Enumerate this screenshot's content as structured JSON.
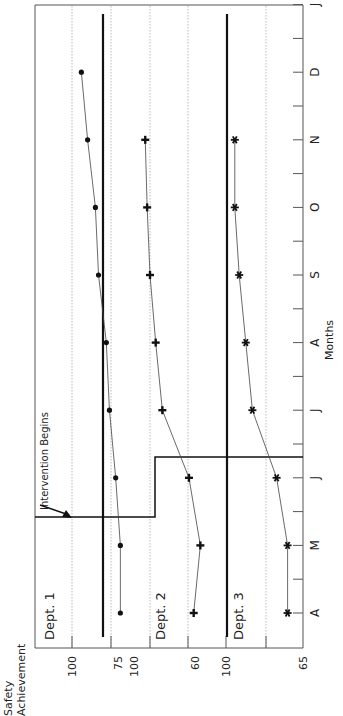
{
  "chart_data": {
    "type": "line",
    "orientation": "rotated-90-clockwise",
    "title": "",
    "xlabel": "Months",
    "ylabel": "Safety Achievement",
    "categories": [
      "A",
      "M",
      "J",
      "J",
      "A",
      "S",
      "O",
      "N",
      "D",
      "J"
    ],
    "intervention_label": "Intervention Begins",
    "panels": [
      {
        "name": "Dept. 1",
        "marker": "circle",
        "y_ticks": [
          100,
          75
        ],
        "ylim": [
          100,
          60
        ],
        "intervention_after_index": 2,
        "values": [
          69,
          69,
          72,
          76,
          78,
          83,
          85,
          90,
          94
        ]
      },
      {
        "name": "Dept. 2",
        "marker": "plus",
        "y_ticks": [
          100,
          60
        ],
        "ylim": [
          100,
          0
        ],
        "intervention_after_index": 2,
        "values": [
          54,
          47,
          59,
          87,
          94,
          100,
          103,
          105
        ]
      },
      {
        "name": "Dept. 3",
        "marker": "star",
        "y_ticks": [
          100,
          65
        ],
        "ylim": [
          100,
          65
        ],
        "intervention_after_index": 3,
        "values": [
          72,
          72,
          77,
          88,
          91,
          94,
          96,
          96
        ]
      }
    ],
    "grid": true,
    "legend": "none"
  }
}
